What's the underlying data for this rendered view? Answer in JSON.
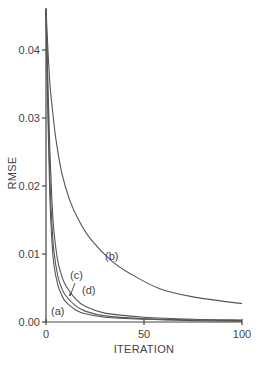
{
  "chart_data": {
    "type": "line",
    "title": "",
    "xlabel": "ITERATION",
    "ylabel": "RMSE",
    "xlim": [
      0,
      100
    ],
    "ylim": [
      0,
      0.046
    ],
    "grid": false,
    "legend": "inline curve labels",
    "x_ticks": [
      {
        "value": 0,
        "label": "0"
      },
      {
        "value": 50,
        "label": "50"
      },
      {
        "value": 100,
        "label": "100"
      }
    ],
    "y_ticks": [
      {
        "value": 0.0,
        "label": "0.00"
      },
      {
        "value": 0.01,
        "label": "0.01"
      },
      {
        "value": 0.02,
        "label": "0.02"
      },
      {
        "value": 0.03,
        "label": "0.03"
      },
      {
        "value": 0.04,
        "label": "0.04"
      }
    ],
    "series": [
      {
        "name": "(a)",
        "x": [
          0,
          1,
          2,
          3,
          4,
          6,
          8,
          10,
          15,
          20,
          30,
          50,
          75,
          100
        ],
        "values": [
          0.046,
          0.03,
          0.018,
          0.012,
          0.0085,
          0.0055,
          0.004,
          0.003,
          0.0018,
          0.0012,
          0.0007,
          0.0004,
          0.0002,
          0.0001
        ]
      },
      {
        "name": "(b)",
        "x": [
          0,
          1,
          2,
          3,
          5,
          8,
          12,
          17,
          23,
          33,
          43,
          58,
          75,
          100
        ],
        "values": [
          0.046,
          0.04,
          0.035,
          0.032,
          0.027,
          0.022,
          0.018,
          0.0148,
          0.0121,
          0.0091,
          0.0071,
          0.0049,
          0.0037,
          0.0027
        ]
      },
      {
        "name": "(c)",
        "x": [
          0,
          1,
          2,
          3,
          4,
          6,
          8,
          10,
          15,
          20,
          30,
          50,
          75,
          100
        ],
        "values": [
          0.046,
          0.032,
          0.021,
          0.0145,
          0.0105,
          0.0068,
          0.005,
          0.0039,
          0.0024,
          0.0016,
          0.0009,
          0.0005,
          0.0003,
          0.0002
        ]
      },
      {
        "name": "(d)",
        "x": [
          0,
          1,
          2,
          3,
          4,
          6,
          8,
          10,
          15,
          20,
          30,
          50,
          75,
          100
        ],
        "values": [
          0.046,
          0.035,
          0.025,
          0.018,
          0.0135,
          0.009,
          0.0068,
          0.0054,
          0.0034,
          0.0023,
          0.0013,
          0.0007,
          0.0004,
          0.0003
        ]
      }
    ],
    "annotations": [
      {
        "text": "(a)",
        "x": 6,
        "y": 0.0015
      },
      {
        "text": "(b)",
        "x": 33,
        "y": 0.0098
      },
      {
        "text": "(c)",
        "x": 14,
        "y": 0.0068,
        "arrow_to": {
          "x": 12,
          "y": 0.0035
        }
      },
      {
        "text": "(d)",
        "x": 21,
        "y": 0.0048
      }
    ]
  },
  "labels": {
    "x_axis": "ITERATION",
    "y_axis": "RMSE",
    "curve_a": "(a)",
    "curve_b": "(b)",
    "curve_c": "(c)",
    "curve_d": "(d)"
  }
}
